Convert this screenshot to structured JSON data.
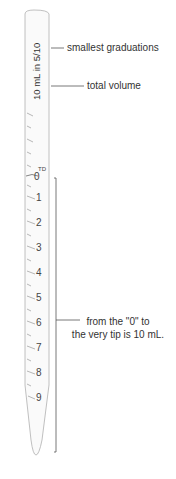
{
  "diagram": {
    "pipette_text": "10 mL in 5/10",
    "td_mark": "TD",
    "scale_numbers": [
      "0",
      "1",
      "2",
      "3",
      "4",
      "5",
      "6",
      "7",
      "8",
      "9"
    ],
    "callouts": {
      "smallest_graduations": "smallest graduations",
      "total_volume": "total volume",
      "range_line1": "from the \"0\" to",
      "range_line2": "the very tip is 10 mL."
    },
    "colors": {
      "outline": "#aaaaaa",
      "text": "#333333",
      "bracket": "#555555"
    }
  }
}
